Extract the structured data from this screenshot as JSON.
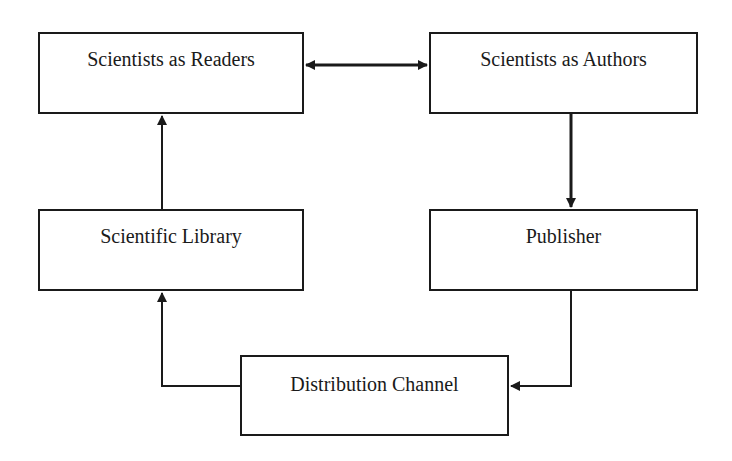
{
  "diagram": {
    "nodes": [
      {
        "id": "readers",
        "label": "Scientists as Readers"
      },
      {
        "id": "authors",
        "label": "Scientists as Authors"
      },
      {
        "id": "library",
        "label": "Scientific Library"
      },
      {
        "id": "publisher",
        "label": "Publisher"
      },
      {
        "id": "distribution",
        "label": "Distribution Channel"
      }
    ],
    "edges": [
      {
        "from": "readers",
        "to": "authors",
        "direction": "bidirectional"
      },
      {
        "from": "authors",
        "to": "publisher",
        "direction": "forward"
      },
      {
        "from": "publisher",
        "to": "distribution",
        "direction": "forward"
      },
      {
        "from": "distribution",
        "to": "library",
        "direction": "forward"
      },
      {
        "from": "library",
        "to": "readers",
        "direction": "forward"
      }
    ],
    "colors": {
      "stroke": "#1a1a1a",
      "background": "#ffffff"
    }
  }
}
